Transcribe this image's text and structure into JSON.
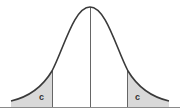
{
  "diagram": {
    "type": "normal-distribution-curve",
    "labels": {
      "left_tail": "c",
      "right_tail": "c"
    },
    "colors": {
      "curve": "#3a3a3a",
      "shade": "#d9d9d9",
      "lines": "#555555",
      "baseline": "#888888",
      "background": "#ffffff"
    },
    "geometry": {
      "mean_x": 90,
      "left_cut_x": 52,
      "right_cut_x": 128,
      "baseline_y": 107
    }
  }
}
